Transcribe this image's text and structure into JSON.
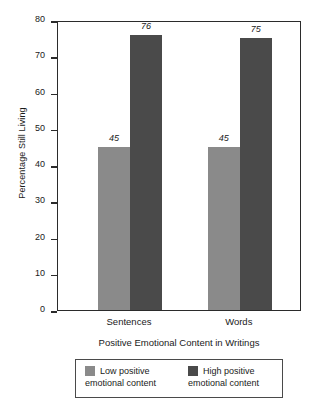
{
  "chart_data": {
    "type": "bar",
    "title": "",
    "subtitle": "",
    "xlabel": "Positive Emotional Content in Writings",
    "ylabel": "Percentage Still Living",
    "categories": [
      "Sentences",
      "Words"
    ],
    "series": [
      {
        "name": "Low positive emotional content",
        "name_line1": "Low positive",
        "name_line2": "emotional content",
        "color": "#8a8a8a",
        "values": [
          45,
          45
        ]
      },
      {
        "name": "High positive emotional content",
        "name_line1": "High positive",
        "name_line2": "emotional content",
        "color": "#4a4a4a",
        "values": [
          76,
          75
        ]
      }
    ],
    "value_labels": [
      [
        "45",
        "76"
      ],
      [
        "45",
        "75"
      ]
    ],
    "ylim": [
      0,
      80
    ],
    "yticks": [
      "0",
      "10",
      "20",
      "30",
      "40",
      "50",
      "60",
      "70",
      "80"
    ],
    "ytick_values": [
      0,
      10,
      20,
      30,
      40,
      50,
      60,
      70,
      80
    ],
    "grid": false,
    "legend_position": "bottom"
  },
  "axes": {
    "y_title": "Percentage Still Living",
    "x_title": "Positive Emotional Content in Writings"
  },
  "legend": {
    "entries": [
      {
        "line1": "Low positive",
        "line2": "emotional content",
        "swatch": "low"
      },
      {
        "line1": "High positive",
        "line2": "emotional content",
        "swatch": "high"
      }
    ]
  }
}
